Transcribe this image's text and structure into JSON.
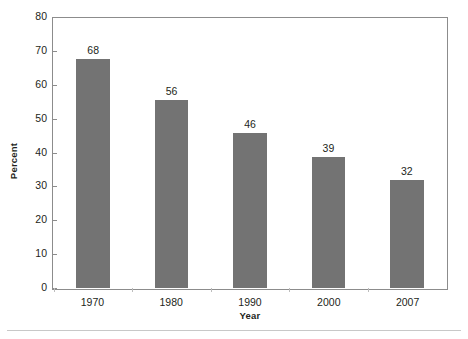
{
  "chart_data": {
    "type": "bar",
    "title": "",
    "subtitle": "",
    "categories": [
      "1970",
      "1980",
      "1990",
      "2000",
      "2007"
    ],
    "values": [
      68,
      56,
      46,
      39,
      32
    ],
    "data_labels": [
      "68",
      "56",
      "46",
      "39",
      "32"
    ],
    "xlabel": "Year",
    "ylabel": "Percent",
    "ylim": [
      0,
      80
    ],
    "ytick_step": 10,
    "ytick_labels": [
      "0",
      "10",
      "20",
      "30",
      "40",
      "50",
      "60",
      "70",
      "80"
    ],
    "grid": false,
    "legend": false,
    "legend_position": "none",
    "series": [
      {
        "name": "Percent",
        "values": [
          68,
          56,
          46,
          39,
          32
        ],
        "color": "#737373"
      }
    ]
  },
  "style": {
    "bar_color": "#737373",
    "axis_color": "#8c8c8c",
    "text_color": "#231f20",
    "background": "#ffffff",
    "rule_color": "#c8c8c8"
  }
}
